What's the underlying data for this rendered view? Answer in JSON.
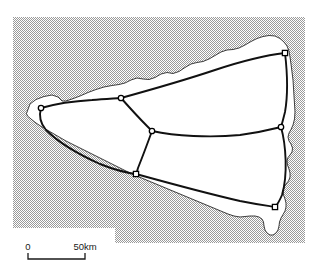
{
  "figure": {
    "type": "thematic-map",
    "title": "",
    "background_color": "#ffffff",
    "sea_fill_color": "#c9c9c9",
    "land_fill_color": "#ffffff",
    "coastline_color": "#2b2b2b",
    "road_color": "#111111",
    "node_stroke_color": "#000000",
    "node_fill_color": "#ffffff"
  },
  "scale_bar": {
    "name": "distance-scale",
    "start_label": "0",
    "end_label": "50km",
    "unit": "km",
    "span_value": 50,
    "bar_x_start": 28,
    "bar_x_end": 85,
    "bar_y": 259
  },
  "map_data": {
    "sea_polygon": "13,17 305,17 305,243 115,243 115,228 13,228",
    "coastline": "26.5,113.5 30,104 36,99.5 44,96.5 52,95 58,97 62,101 66,101 72,99 80,96 88,92.5 96,89.5 104,87 112,85.5 119,84.5 125,83 131,80 137,78 143,79 149,79.5 155,77.5 161,74 167,72.5 173,73.5 179,71.5 185,67.5 191,64 197,62.5 203,61.5 209,59 215,55.5 221,52 227,50 233,49.5 239,48 245,45 251,41.5 257,38.5 263,36.5 269,35.5 275,36 280,38.5 284,42 287,46 289,51 290,57 291,64 292,72 293,80 293.5,88 294,96 294.5,104 295,112 294.5,119 293,125 291,129.5 289,133 288,137 289,141 291,144 292.5,148 292,152 290,155 288,157.5 287,161 287.5,165 289,169 290,173 290,177 288.5,181 286,184 284,187.5 283,191 283.5,195 285,199 286,203 286,207 285,211 283,214.5 281,218 279.5,222 279,226 278,230 276,233 273,235 270,235 267,233 265,230 264,226 263.5,222 262,219 259,217 255,216 250,216 245,216.5 240,217 234,216 228,214 222,211.5 216,209 210,206.5 204,204 198,201.5 192,199 186,196.5 180,194 174,191.5 168,189 162,186.5 156,184 150,181.5 144,179 138,176.5 132,174 126,171 120,168 114,165 108,162 102,159 96,156 90,153 84,150 78,147 72,144 66,141 60,137.5 54,134 48,130.5 42,127 36,123 31,119 27.5,116 26.5,113.5",
    "nodes": [
      {
        "id": "n1",
        "name": "node-west",
        "x": 41,
        "y": 108,
        "shape": "circle"
      },
      {
        "id": "n2",
        "name": "node-north-west",
        "x": 121,
        "y": 98,
        "shape": "circle"
      },
      {
        "id": "n3",
        "name": "node-north-east",
        "x": 285,
        "y": 53,
        "shape": "square"
      },
      {
        "id": "n4",
        "name": "node-centre",
        "x": 152,
        "y": 131,
        "shape": "circle"
      },
      {
        "id": "n5",
        "name": "node-east",
        "x": 281,
        "y": 127,
        "shape": "circle"
      },
      {
        "id": "n6",
        "name": "node-south-centre",
        "x": 136,
        "y": 174,
        "shape": "square"
      },
      {
        "id": "n7",
        "name": "node-south-east",
        "x": 275,
        "y": 207,
        "shape": "square"
      }
    ],
    "roads": [
      {
        "id": "r1",
        "name": "road-west-to-northwest",
        "from": "n1",
        "to": "n2",
        "path": "M41,108 C55,104 75,101 92,100 C104,99 114,98.5 121,98"
      },
      {
        "id": "r2",
        "name": "road-northwest-to-northeast",
        "from": "n2",
        "to": "n3",
        "path": "M121,98 C150,90 185,80 215,70 C245,60 268,55 285,53"
      },
      {
        "id": "r3",
        "name": "road-northwest-to-centre",
        "from": "n2",
        "to": "n4",
        "path": "M121,98 C129,107 140,119 147,126 C150,129 151,130 152,131"
      },
      {
        "id": "r4",
        "name": "road-centre-to-east",
        "from": "n4",
        "to": "n5",
        "path": "M152,131 C175,136 210,138 240,135 C262,132 273,129 281,127"
      },
      {
        "id": "r5",
        "name": "road-northeast-to-east",
        "from": "n3",
        "to": "n5",
        "path": "M285,53 C287,70 288,95 285,112 C283,120 282,124 281,127"
      },
      {
        "id": "r6",
        "name": "road-centre-to-southcentre",
        "from": "n4",
        "to": "n6",
        "path": "M152,131 C148,142 142,158 138,168 C137,172 136.5,173 136,174"
      },
      {
        "id": "r7",
        "name": "road-southcentre-to-southeast",
        "from": "n6",
        "to": "n7",
        "path": "M136,174 C165,182 205,193 240,201 C260,205 270,206 275,207"
      },
      {
        "id": "r8",
        "name": "road-east-to-southeast",
        "from": "n5",
        "to": "n7",
        "path": "M281,127 C286,145 288,175 282,195 C279,202 277,205 275,207"
      },
      {
        "id": "r9",
        "name": "road-west-to-south-coastal",
        "from": "n1",
        "to": "n6",
        "path": "M41,108 C39,115 40,123 46,130 C58,142 80,155 100,164 C115,170 128,173 136,174"
      }
    ]
  }
}
